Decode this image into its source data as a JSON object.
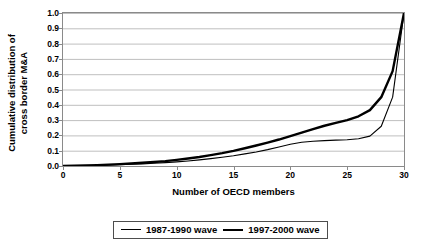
{
  "chart_data": {
    "type": "line",
    "title": "",
    "xlabel": "Number of OECD members",
    "ylabel": "Cumulative distribution of cross border M&A",
    "ylabel_line1": "Cumulative distribution of",
    "ylabel_line2": "cross border M&A",
    "xlim": [
      0,
      30
    ],
    "ylim": [
      0,
      1.0
    ],
    "xticks": [
      0,
      5,
      10,
      15,
      20,
      25,
      30
    ],
    "xtick_labels": [
      "0",
      "5",
      "10",
      "15",
      "20",
      "25",
      "30"
    ],
    "yticks": [
      0.0,
      0.1,
      0.2,
      0.3,
      0.4,
      0.5,
      0.6,
      0.7,
      0.8,
      0.9,
      1.0
    ],
    "ytick_labels": [
      "0.0",
      "0.1",
      "0.2",
      "0.3",
      "0.4",
      "0.5",
      "0.6",
      "0.7",
      "0.8",
      "0.9",
      "1.0"
    ],
    "grid": "horizontal",
    "grid_color": "#bfbfbf",
    "axis_color": "#8a8a8a",
    "legend_position": "bottom-center",
    "series": [
      {
        "name": "1987-1990 wave",
        "color": "#000000",
        "line_width": 1.1,
        "style": "thin",
        "x": [
          0,
          1,
          2,
          3,
          4,
          5,
          6,
          7,
          8,
          9,
          10,
          11,
          12,
          13,
          14,
          15,
          16,
          17,
          18,
          19,
          20,
          21,
          22,
          23,
          24,
          25,
          26,
          27,
          28,
          29,
          30
        ],
        "values": [
          0.0,
          0.001,
          0.002,
          0.004,
          0.006,
          0.008,
          0.011,
          0.014,
          0.018,
          0.022,
          0.027,
          0.033,
          0.04,
          0.048,
          0.057,
          0.067,
          0.079,
          0.092,
          0.107,
          0.124,
          0.142,
          0.155,
          0.162,
          0.166,
          0.169,
          0.172,
          0.178,
          0.195,
          0.26,
          0.45,
          1.0
        ]
      },
      {
        "name": "1997-2000 wave",
        "color": "#000000",
        "line_width": 2.4,
        "style": "thick",
        "x": [
          0,
          1,
          2,
          3,
          4,
          5,
          6,
          7,
          8,
          9,
          10,
          11,
          12,
          13,
          14,
          15,
          16,
          17,
          18,
          19,
          20,
          21,
          22,
          23,
          24,
          25,
          26,
          27,
          28,
          29,
          30
        ],
        "values": [
          0.0,
          0.002,
          0.004,
          0.006,
          0.009,
          0.012,
          0.016,
          0.021,
          0.026,
          0.032,
          0.04,
          0.049,
          0.059,
          0.071,
          0.084,
          0.099,
          0.116,
          0.134,
          0.153,
          0.173,
          0.195,
          0.218,
          0.241,
          0.263,
          0.282,
          0.3,
          0.325,
          0.365,
          0.45,
          0.62,
          1.0
        ]
      }
    ]
  },
  "legend": {
    "entries": [
      {
        "label": "1987-1990 wave"
      },
      {
        "label": "1997-2000 wave"
      }
    ]
  }
}
